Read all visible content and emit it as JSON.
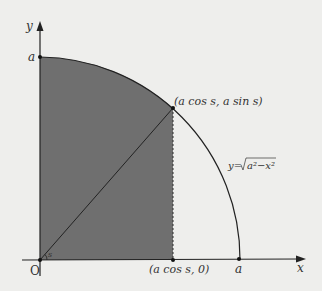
{
  "diagram": {
    "axes": {
      "x_label": "x",
      "y_label": "y",
      "origin_label": "O"
    },
    "labels": {
      "a_on_y": "a",
      "a_on_x": "a",
      "point_on_curve": "(a cos s, a sin s)",
      "point_on_x_axis": "(a cos s, 0)",
      "angle": "s",
      "curve_eq_prefix": "y=",
      "curve_eq_radicand": "a²−x²"
    },
    "colors": {
      "background": "#eeeeec",
      "shaded_region": "#6f6f6f",
      "lines": "#222222"
    }
  }
}
